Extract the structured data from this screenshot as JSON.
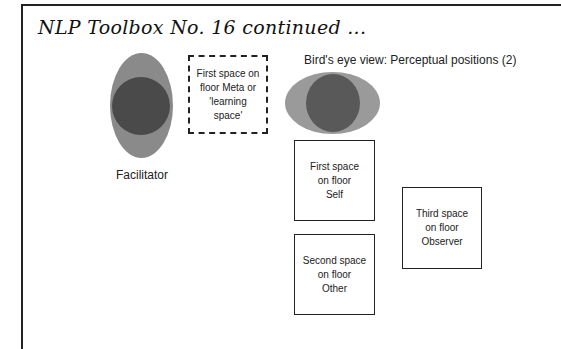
{
  "page": {
    "title": "NLP Toolbox No. 16 continued ..."
  },
  "facilitator": {
    "label": "Facilitator",
    "outer_color": "#8a8a8a",
    "inner_color": "#4a4a4a"
  },
  "meta_space": {
    "text": "First space on floor Meta or 'learning space'"
  },
  "birds_eye": {
    "heading": "Bird's eye view: Perceptual positions (2)",
    "outer_color": "#9a9a9a",
    "inner_color": "#595959"
  },
  "boxes": [
    {
      "id": "self",
      "text": "First space\non floor\nSelf"
    },
    {
      "id": "other",
      "text": "Second space\non floor\nOther"
    },
    {
      "id": "observer",
      "text": "Third space\non floor\nObserver"
    }
  ]
}
